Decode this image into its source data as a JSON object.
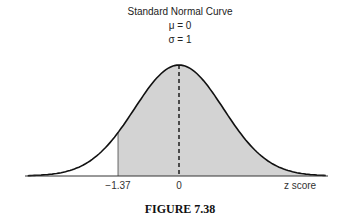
{
  "chart_data": {
    "type": "area",
    "title": "Standard Normal Curve",
    "subtitle_lines": [
      "μ = 0",
      "σ = 1"
    ],
    "distribution": "normal",
    "mean": 0,
    "sd": 1,
    "shaded_region": {
      "from": -1.37,
      "to": "inf"
    },
    "reference_line": {
      "x": 0,
      "style": "dashed"
    },
    "xlabel": "z score",
    "x_ticks": [
      -1.37,
      0
    ],
    "x_tick_labels": [
      "−1.37",
      "0"
    ],
    "caption": "FIGURE 7.38",
    "colors": {
      "curve": "#111111",
      "shade": "#d3d3d3",
      "axis": "#333333"
    }
  },
  "labels": {
    "title": "Standard Normal Curve",
    "mu": "μ = 0",
    "sigma": "σ = 1",
    "tick_neg": "−1.37",
    "tick_zero": "0",
    "xlabel": "z score",
    "caption": "FIGURE 7.38"
  }
}
